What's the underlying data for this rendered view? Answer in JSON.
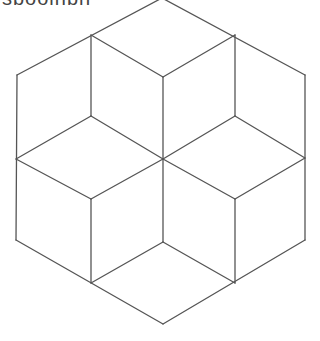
{
  "caption": {
    "text": "sbooinbn",
    "note": "cropped text at top edge, illegible"
  },
  "figure": {
    "type": "tumbling-blocks hexagon line drawing",
    "stroke_color": "#555555",
    "background": "#ffffff",
    "vertices": {
      "top": [
        162,
        -2
      ],
      "ul_inner": [
        91,
        35
      ],
      "ur_inner": [
        235,
        35
      ],
      "left_top": [
        17,
        75
      ],
      "right_top": [
        305,
        75
      ],
      "center_top": [
        163,
        77
      ],
      "ul_mid": [
        91,
        116
      ],
      "ur_mid": [
        235,
        116
      ],
      "left_mid": [
        16,
        159
      ],
      "center": [
        163,
        159
      ],
      "right_mid": [
        305,
        158
      ],
      "ll_mid": [
        91,
        199
      ],
      "lr_mid": [
        235,
        199
      ],
      "left_bottom": [
        16,
        240
      ],
      "center_bottom": [
        163,
        242
      ],
      "right_bottom": [
        305,
        240
      ],
      "ll_inner": [
        91,
        283
      ],
      "lr_inner": [
        235,
        283
      ],
      "bottom": [
        163,
        324
      ]
    }
  }
}
